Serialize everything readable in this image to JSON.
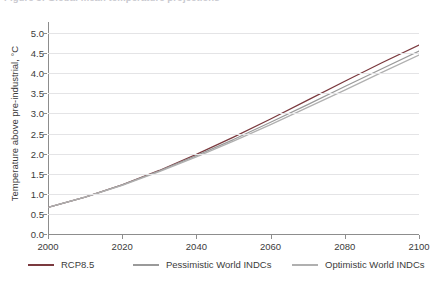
{
  "figure": {
    "clipped_title": "Figure 5: Global mean temperature projections",
    "background": "#ffffff"
  },
  "chart_data": {
    "type": "line",
    "title": "",
    "xlabel": "",
    "ylabel": "Temperature above pre-industrial, °C",
    "xlim": [
      2000,
      2100
    ],
    "ylim": [
      0.0,
      5.0
    ],
    "xticks": [
      2000,
      2020,
      2040,
      2060,
      2080,
      2100
    ],
    "xtick_labels": [
      "2000",
      "2020",
      "2040",
      "2060",
      "2080",
      "2100"
    ],
    "yticks": [
      0.0,
      0.5,
      1.0,
      1.5,
      2.0,
      2.5,
      3.0,
      3.5,
      4.0,
      4.5,
      5.0
    ],
    "ytick_labels": [
      "0.0",
      "0.5",
      "1.0",
      "1.5",
      "2.0",
      "2.5",
      "3.0",
      "3.5",
      "4.0",
      "4.5",
      "5.0"
    ],
    "grid": true,
    "grid_color": "#e4e4e6",
    "legend_position": "bottom",
    "x": [
      2000,
      2010,
      2020,
      2030,
      2040,
      2050,
      2060,
      2070,
      2080,
      2090,
      2100
    ],
    "series": [
      {
        "name": "RCP8.5",
        "color": "#7b3a3f",
        "values": [
          0.66,
          0.92,
          1.22,
          1.58,
          1.98,
          2.41,
          2.86,
          3.33,
          3.8,
          4.26,
          4.7
        ]
      },
      {
        "name": "Pessimistic World INDCs",
        "color": "#9a9a9a",
        "values": [
          0.66,
          0.92,
          1.22,
          1.57,
          1.95,
          2.35,
          2.78,
          3.22,
          3.67,
          4.11,
          4.55
        ]
      },
      {
        "name": "Optimistic World INDCs",
        "color": "#b0b0b0",
        "values": [
          0.66,
          0.92,
          1.21,
          1.55,
          1.92,
          2.31,
          2.72,
          3.15,
          3.58,
          4.02,
          4.45
        ]
      }
    ]
  },
  "legend": {
    "items": [
      {
        "label": "RCP8.5",
        "color": "#7b3a3f"
      },
      {
        "label": "Pessimistic World INDCs",
        "color": "#9a9a9a"
      },
      {
        "label": "Optimistic World INDCs",
        "color": "#b0b0b0"
      }
    ]
  }
}
